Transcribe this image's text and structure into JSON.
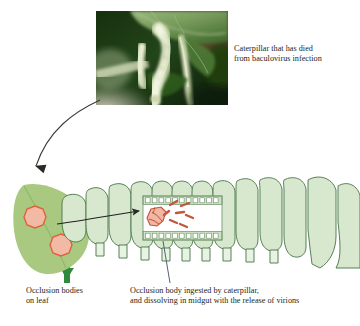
{
  "figure": {
    "background_color": "#ffffff"
  },
  "photo": {
    "alt_label": "photo-dead-caterpillar-on-leaf",
    "description": "Pale yellow-white caterpillar killed by baculovirus hanging from a green leaf",
    "colors": {
      "leaf_dark": "#1f4417",
      "leaf_mid": "#3c6b2a",
      "leaf_light": "#8fae74",
      "caterpillar_body": "#e9efd2",
      "caterpillar_shadow": "#b9c79a",
      "background_dark": "#101e0b",
      "background_brown": "#6b4a33",
      "stem_pale": "#c9cfae"
    }
  },
  "labels": {
    "photo_caption": "Caterpillar that has died\nfrom baculovirus infection",
    "occlusion_leaf_caption": "Occlusion bodies\non leaf",
    "midgut_caption": "Occlusion body ingested by caterpillar,\nand dissolving in midgut with the release of virions"
  },
  "diagram": {
    "leaf": {
      "name": "leaf-with-occlusion-bodies",
      "fill": "#a8c97f",
      "stem_fill": "#2f8a3e",
      "occlusion_bodies": [
        {
          "name": "occlusion-body-upper",
          "cx": 35,
          "cy": 217,
          "r": 11
        },
        {
          "name": "occlusion-body-lower",
          "cx": 61,
          "cy": 245,
          "r": 11
        }
      ],
      "occlusion_fill": "#f2b9a4",
      "occlusion_stroke": "#e0603c"
    },
    "caterpillar": {
      "name": "caterpillar-body",
      "segment_fill": "#d7e8cf",
      "segment_stroke": "#4f7a4e",
      "leg_fill": "#e4f0dd",
      "segment_count": 12
    },
    "midgut_box": {
      "name": "midgut-detail-box",
      "x": 143,
      "y": 196,
      "width": 79,
      "height": 44,
      "interior_fill": "#ffffff",
      "band_fill": "#cfe3c6",
      "cell_fill": "#ffffff",
      "cell_count": 11,
      "occlusion_body_fill": "#f0b7a2",
      "occlusion_body_stroke": "#c4503a",
      "virion_fill": "#c4563c",
      "virion_count": 7
    },
    "arrows": [
      {
        "name": "arrow-photo-to-leaf",
        "from": "photograph",
        "to": "leaf",
        "color": "#3d3a36"
      },
      {
        "name": "arrow-leaf-to-midgut",
        "from": "occlusion bodies on leaf",
        "to": "midgut detail box",
        "color": "#231f20"
      },
      {
        "name": "leader-line-midgut-caption",
        "from": "midgut detail box",
        "to": "midgut caption",
        "color": "#4a5a6a"
      }
    ]
  }
}
